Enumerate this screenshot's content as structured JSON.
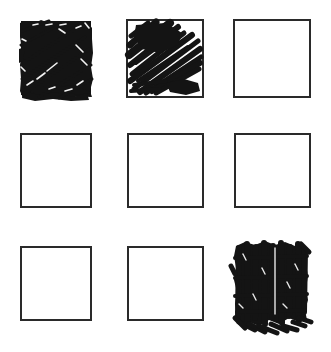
{
  "canvas": {
    "width": 331,
    "height": 352,
    "background_color": "#ffffff",
    "ink_color": "#1a1a1a",
    "outline_color": "#2a2a2a",
    "outline_width": 2,
    "description": "Hand-drawn 3 by 3 grid of square outlines; three squares are filled with pen scribble"
  },
  "grid": {
    "rows": 3,
    "columns": 3,
    "column_x": [
      19,
      126,
      233
    ],
    "row_y": [
      19,
      133,
      246
    ],
    "cell_width": 77,
    "cell_height": 77
  },
  "cells": [
    {
      "id": "cell-r1c1",
      "row": 1,
      "column": 1,
      "position_label": "top-left",
      "fill_state": "filled",
      "fill_style": "dense-scrawl",
      "outline_visible": false,
      "x": 19,
      "y": 19,
      "width": 74,
      "height": 78
    },
    {
      "id": "cell-r1c2",
      "row": 1,
      "column": 2,
      "position_label": "top-middle",
      "fill_state": "filled",
      "fill_style": "diagonal-hatch-scribble",
      "outline_visible": true,
      "x": 126,
      "y": 19,
      "width": 77,
      "height": 78
    },
    {
      "id": "cell-r1c3",
      "row": 1,
      "column": 3,
      "position_label": "top-right",
      "fill_state": "empty",
      "fill_style": "none",
      "outline_visible": true,
      "x": 233,
      "y": 19,
      "width": 77,
      "height": 78
    },
    {
      "id": "cell-r2c1",
      "row": 2,
      "column": 1,
      "position_label": "middle-left",
      "fill_state": "empty",
      "fill_style": "none",
      "outline_visible": true,
      "x": 20,
      "y": 133,
      "width": 71,
      "height": 74
    },
    {
      "id": "cell-r2c2",
      "row": 2,
      "column": 2,
      "position_label": "center",
      "fill_state": "empty",
      "fill_style": "none",
      "outline_visible": true,
      "x": 127,
      "y": 133,
      "width": 76,
      "height": 74
    },
    {
      "id": "cell-r2c3",
      "row": 2,
      "column": 3,
      "position_label": "middle-right",
      "fill_state": "empty",
      "fill_style": "none",
      "outline_visible": true,
      "x": 234,
      "y": 133,
      "width": 76,
      "height": 74
    },
    {
      "id": "cell-r3c1",
      "row": 3,
      "column": 1,
      "position_label": "bottom-left",
      "fill_state": "empty",
      "fill_style": "none",
      "outline_visible": true,
      "x": 20,
      "y": 246,
      "width": 71,
      "height": 74
    },
    {
      "id": "cell-r3c2",
      "row": 3,
      "column": 2,
      "position_label": "bottom-middle",
      "fill_state": "empty",
      "fill_style": "none",
      "outline_visible": true,
      "x": 127,
      "y": 246,
      "width": 76,
      "height": 74
    },
    {
      "id": "cell-r3c3",
      "row": 3,
      "column": 3,
      "position_label": "bottom-right",
      "fill_state": "filled",
      "fill_style": "dense-vertical-scribble",
      "outline_visible": false,
      "x": 231,
      "y": 240,
      "width": 82,
      "height": 92
    }
  ],
  "summary": {
    "total_cells": 9,
    "filled_cells": 3,
    "empty_cells": 6,
    "filled_positions": [
      "top-left",
      "top-middle",
      "bottom-right"
    ]
  }
}
